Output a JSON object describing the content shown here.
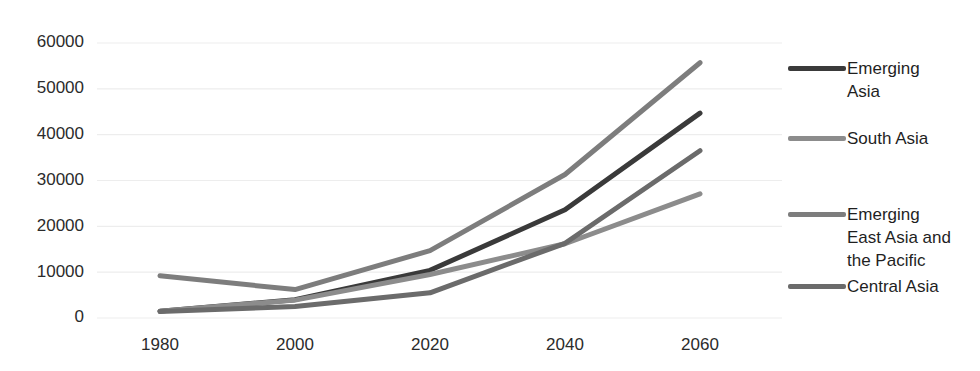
{
  "chart_data": {
    "type": "line",
    "title": "",
    "subtitle": "",
    "xlabel": "",
    "ylabel": "",
    "categories": [
      "1980",
      "2000",
      "2020",
      "2040",
      "2060"
    ],
    "x": [
      1980,
      2000,
      2020,
      2040,
      2060
    ],
    "ylim": [
      0,
      60000
    ],
    "xlim": [
      1980,
      2060
    ],
    "yticks": [
      0,
      10000,
      20000,
      30000,
      40000,
      50000,
      60000
    ],
    "ytick_labels": [
      "0",
      "10000",
      "20000",
      "30000",
      "40000",
      "50000",
      "60000"
    ],
    "xtick_labels": [
      "1980",
      "2000",
      "2020",
      "2040",
      "2060"
    ],
    "grid": "horizontal",
    "legend_position": "right",
    "background_color": "#ffffff",
    "gridline_color": "#ededed",
    "series": [
      {
        "name": "Emerging Asia",
        "color": "#3a3a3a",
        "values": [
          1500,
          4000,
          10400,
          23600,
          44700
        ]
      },
      {
        "name": "South Asia",
        "color": "#8c8c8c",
        "values": [
          1500,
          3900,
          9500,
          16200,
          27100
        ]
      },
      {
        "name": "Emerging East Asia and the Pacific",
        "color": "#7d7d7d",
        "values": [
          9200,
          6200,
          14700,
          31300,
          55700
        ]
      },
      {
        "name": "Central Asia",
        "color": "#6b6b6b",
        "values": [
          1400,
          2500,
          5500,
          16300,
          36500
        ]
      }
    ]
  },
  "legend": {
    "entries": [
      {
        "label": "Emerging\nAsia",
        "color": "#3a3a3a",
        "top": 57
      },
      {
        "label": "South Asia",
        "color": "#8c8c8c",
        "top": 127
      },
      {
        "label": "Emerging\nEast Asia and\nthe Pacific",
        "color": "#7d7d7d",
        "top": 203
      },
      {
        "label": "Central Asia",
        "color": "#6b6b6b",
        "top": 275
      }
    ]
  }
}
